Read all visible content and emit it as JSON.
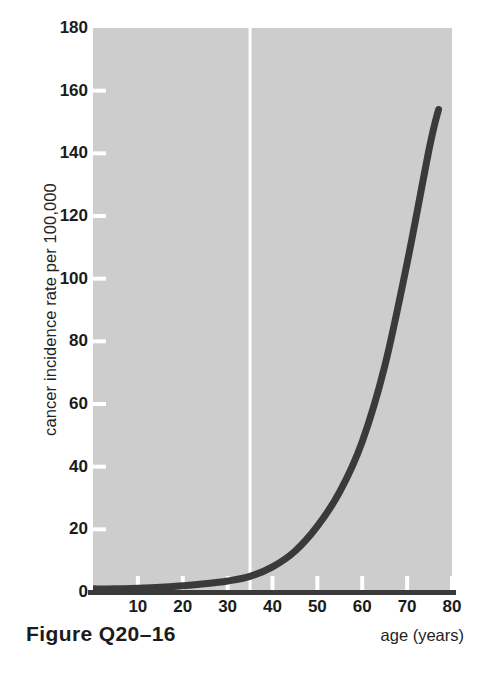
{
  "figure": {
    "caption": "Figure Q20–16"
  },
  "chart_data": {
    "type": "line",
    "title": "",
    "subtitle": "",
    "xlabel": "age (years)",
    "ylabel": "cancer incidence rate per 100,000",
    "xlim": [
      0,
      80
    ],
    "ylim": [
      0,
      180
    ],
    "grid": false,
    "legend": "none",
    "plot_background_color": "#cdcdcd",
    "line_color": "#3a3a3a",
    "line_width_px": 7,
    "xticks": [
      0,
      10,
      20,
      30,
      40,
      50,
      60,
      70,
      80
    ],
    "xtick_labels": [
      "",
      "10",
      "20",
      "30",
      "40",
      "50",
      "60",
      "70",
      "80"
    ],
    "yticks": [
      0,
      20,
      40,
      60,
      80,
      100,
      120,
      140,
      160,
      180
    ],
    "ytick_labels": [
      "0",
      "20",
      "40",
      "60",
      "80",
      "100",
      "120",
      "140",
      "160",
      "180"
    ],
    "annotations": [
      {
        "name": "vertical-reference-line",
        "type": "vline",
        "x": 35,
        "color": "#ffffff",
        "width_px": 3
      }
    ],
    "series": [
      {
        "name": "cancer incidence rate",
        "x": [
          0,
          5,
          10,
          15,
          20,
          25,
          30,
          35,
          40,
          45,
          50,
          55,
          60,
          65,
          70,
          75,
          77
        ],
        "y": [
          1,
          1,
          1.2,
          1.5,
          2,
          2.6,
          3.5,
          5,
          8,
          13,
          21,
          32,
          48,
          72,
          105,
          142,
          154
        ]
      }
    ]
  }
}
